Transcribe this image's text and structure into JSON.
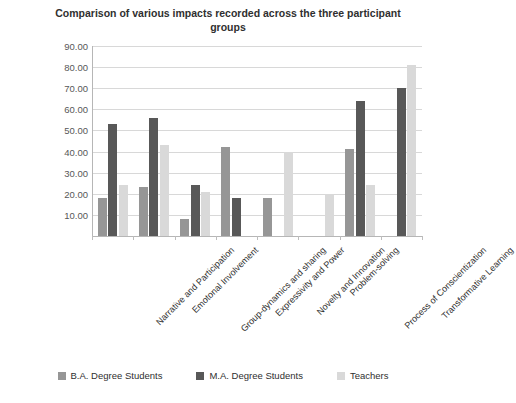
{
  "chart_data": {
    "type": "bar",
    "title": "Comparison of various impacts recorded across the three participant groups",
    "xlabel": "",
    "ylabel": "Percent",
    "ylim": [
      0,
      90
    ],
    "ytick_step": 10,
    "ytick_labels": [
      "90.00",
      "80.00",
      "70.00",
      "60.00",
      "50.00",
      "40.00",
      "30.00",
      "20.00",
      "10.00"
    ],
    "ytick_values": [
      90,
      80,
      70,
      60,
      50,
      40,
      30,
      20,
      10
    ],
    "grid": "horizontal",
    "legend_position": "bottom",
    "categories": [
      "Narrative and Participation",
      "Emotonal Involvement",
      "Group-dynamics and sharing",
      "Expressivity and Power",
      "Novelty and Innovation",
      "Problem-solving",
      "Process of Conscientization",
      "Transformative Learning"
    ],
    "series": [
      {
        "name": "B.A. Degree Students",
        "color": "#969696",
        "values": [
          18,
          23,
          8,
          42,
          18,
          null,
          41,
          null
        ]
      },
      {
        "name": "M.A. Degree Students",
        "color": "#585858",
        "values": [
          53,
          56,
          24,
          18,
          null,
          null,
          64,
          70
        ]
      },
      {
        "name": "Teachers",
        "color": "#d9d9d9",
        "values": [
          24,
          43,
          21,
          null,
          40,
          20,
          24,
          81
        ]
      }
    ]
  },
  "colors": {
    "background": "#ffffff",
    "grid": "#d8d8d8",
    "axis": "#b6b6b6",
    "text": "#2f2f2f",
    "tick_text": "#575757"
  }
}
